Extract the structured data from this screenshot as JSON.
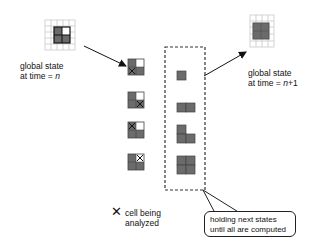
{
  "diagram": {
    "left_state": {
      "label_line1": "global state",
      "label_line2_prefix": "at time = ",
      "label_line2_var": "n",
      "grid": {
        "cols": 5,
        "rows": 5,
        "block": [
          [
            "dark",
            "white"
          ],
          [
            "dark",
            "dark"
          ]
        ]
      }
    },
    "right_state": {
      "label_line1": "global state",
      "label_line2_prefix": "at time = ",
      "label_line2_var": "n",
      "label_line2_suffix": "+1",
      "grid": {
        "cols": 4,
        "rows": 5,
        "block": [
          [
            "dark",
            "dark"
          ],
          [
            "dark",
            "dark"
          ]
        ]
      }
    },
    "analysis_steps": [
      {
        "cells": [
          [
            "dark",
            "white"
          ],
          [
            "dark-x",
            "dark"
          ]
        ]
      },
      {
        "cells": [
          [
            "dark",
            "white"
          ],
          [
            "dark",
            "dark-x"
          ]
        ]
      },
      {
        "cells": [
          [
            "dark-x",
            "white"
          ],
          [
            "dark",
            "dark"
          ]
        ]
      },
      {
        "cells": [
          [
            "dark",
            "white-x"
          ],
          [
            "dark",
            "dark"
          ]
        ]
      }
    ],
    "held_states": [
      {
        "cells": [
          "bl"
        ]
      },
      {
        "cells": [
          "bl",
          "br"
        ]
      },
      {
        "cells": [
          "tl",
          "bl",
          "br"
        ]
      },
      {
        "cells": [
          "tl",
          "tr",
          "bl",
          "br"
        ]
      }
    ],
    "legend": {
      "symbol": "✕",
      "line1": "cell being",
      "line2": "analyzed"
    },
    "callout": {
      "line1": "holding next states",
      "line2": "until all are computed"
    },
    "colors": {
      "dark": "#6b6b6b",
      "grid": "#c8c8c8",
      "line": "#111111"
    }
  }
}
